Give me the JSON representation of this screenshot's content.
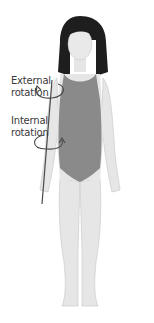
{
  "diagram": {
    "type": "anatomical-illustration",
    "labels": {
      "external": [
        "External",
        "rotation"
      ],
      "internal": [
        "Internal",
        "rotation"
      ]
    },
    "colors": {
      "skin": "#e6e6e6",
      "skin_shadow": "#cfcfcf",
      "swimsuit": "#8a8a8a",
      "hair": "#1e1e1e",
      "axis_line": "#4a4a4a",
      "arrows": "#4a4a4a",
      "text": "#3a3a3a"
    }
  }
}
